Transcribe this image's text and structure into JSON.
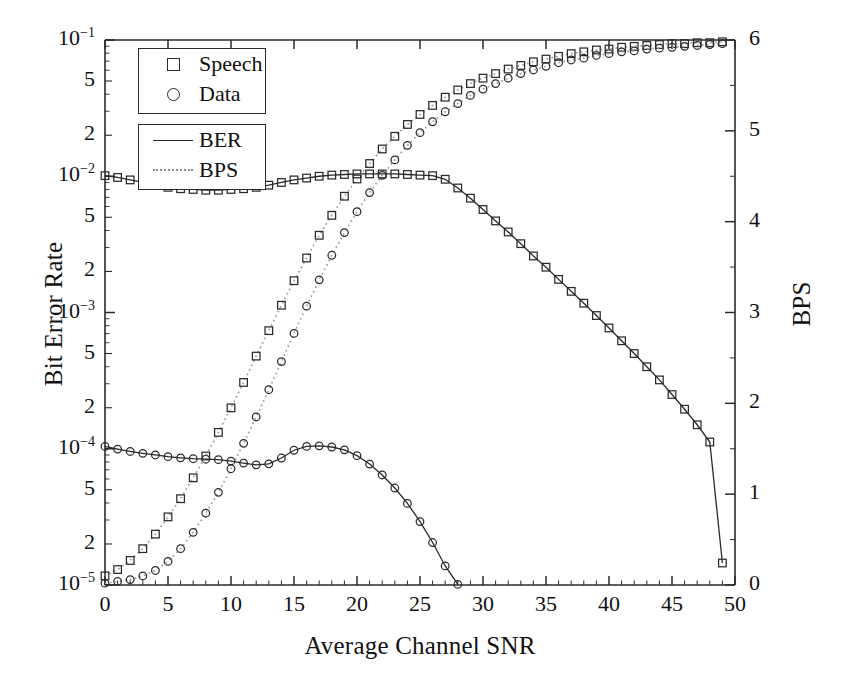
{
  "chart_data": {
    "type": "line",
    "title": "",
    "xlabel": "Average Channel SNR",
    "ylabel": "Bit Error Rate",
    "ylabel_right": "BPS",
    "xlim": [
      0,
      50
    ],
    "xticks": [
      0,
      5,
      10,
      15,
      20,
      25,
      30,
      35,
      40,
      45,
      50
    ],
    "ylim_left": [
      1e-05,
      0.1
    ],
    "yscale_left": "log",
    "yticks_left": [
      {
        "value": 0.1,
        "label": "10-1"
      },
      {
        "value": 0.05,
        "label": "5"
      },
      {
        "value": 0.02,
        "label": "2"
      },
      {
        "value": 0.01,
        "label": "10-2"
      },
      {
        "value": 0.005,
        "label": "5"
      },
      {
        "value": 0.002,
        "label": "2"
      },
      {
        "value": 0.001,
        "label": "10-3"
      },
      {
        "value": 0.0005,
        "label": "5"
      },
      {
        "value": 0.0002,
        "label": "2"
      },
      {
        "value": 0.0001,
        "label": "10-4"
      },
      {
        "value": 5e-05,
        "label": "5"
      },
      {
        "value": 2e-05,
        "label": "2"
      },
      {
        "value": 1e-05,
        "label": "10-5"
      }
    ],
    "ylim_right": [
      0,
      6
    ],
    "yticks_right": [
      0,
      1,
      2,
      3,
      4,
      5,
      6
    ],
    "grid": false,
    "legend_position": "upper-left",
    "legend_marker_entries": [
      {
        "label": "Speech",
        "marker": "square"
      },
      {
        "label": "Data",
        "marker": "circle"
      }
    ],
    "legend_style_entries": [
      {
        "label": "BER",
        "style": "solid"
      },
      {
        "label": "BPS",
        "style": "dotted"
      }
    ],
    "series": [
      {
        "name": "Speech BER",
        "marker": "square",
        "style": "solid",
        "axis": "left",
        "x": [
          0,
          1,
          2,
          3,
          4,
          5,
          6,
          7,
          8,
          9,
          10,
          11,
          12,
          13,
          14,
          15,
          16,
          17,
          18,
          19,
          20,
          21,
          22,
          23,
          24,
          25,
          26,
          27,
          28,
          29,
          30,
          31,
          32,
          33,
          34,
          35,
          36,
          37,
          38,
          39,
          40,
          41,
          42,
          43,
          44,
          45,
          46,
          47,
          48,
          49
        ],
        "y": [
          0.0101,
          0.0098,
          0.0094,
          0.009,
          0.0086,
          0.0083,
          0.0081,
          0.008,
          0.0079,
          0.0079,
          0.008,
          0.0081,
          0.0083,
          0.0086,
          0.009,
          0.0094,
          0.0097,
          0.01,
          0.0102,
          0.0103,
          0.0104,
          0.0104,
          0.0104,
          0.0104,
          0.0103,
          0.0102,
          0.0101,
          0.0095,
          0.0082,
          0.0069,
          0.0057,
          0.0047,
          0.0039,
          0.0032,
          0.0026,
          0.00215,
          0.00175,
          0.00143,
          0.00117,
          0.00095,
          0.00077,
          0.00062,
          0.0005,
          0.0004,
          0.00032,
          0.00025,
          0.000195,
          0.00015,
          0.000112,
          1.45e-05
        ]
      },
      {
        "name": "Data BER",
        "marker": "circle",
        "style": "solid",
        "axis": "left",
        "x": [
          0,
          1,
          2,
          3,
          4,
          5,
          6,
          7,
          8,
          9,
          10,
          11,
          12,
          13,
          14,
          15,
          16,
          17,
          18,
          19,
          20,
          21,
          22,
          23,
          24,
          25,
          26,
          27,
          28
        ],
        "y": [
          0.000104,
          9.95e-05,
          9.55e-05,
          9.25e-05,
          9e-05,
          8.75e-05,
          8.58e-05,
          8.45e-05,
          8.38e-05,
          8.32e-05,
          8.12e-05,
          7.85e-05,
          7.62e-05,
          7.75e-05,
          8.55e-05,
          9.75e-05,
          0.000104,
          0.000105,
          0.000103,
          9.82e-05,
          8.9e-05,
          7.72e-05,
          6.42e-05,
          5.15e-05,
          3.97e-05,
          2.92e-05,
          2.05e-05,
          1.38e-05,
          1.01e-05
        ]
      },
      {
        "name": "Speech BPS",
        "marker": "square",
        "style": "dotted",
        "axis": "right",
        "x": [
          0,
          1,
          2,
          3,
          4,
          5,
          6,
          7,
          8,
          9,
          10,
          11,
          12,
          13,
          14,
          15,
          16,
          17,
          18,
          19,
          20,
          21,
          22,
          23,
          24,
          25,
          26,
          27,
          28,
          29,
          30,
          31,
          32,
          33,
          34,
          35,
          36,
          37,
          38,
          39,
          40,
          41,
          42,
          43,
          44,
          45,
          46,
          47,
          48,
          49
        ],
        "y": [
          0.1,
          0.17,
          0.27,
          0.4,
          0.56,
          0.75,
          0.95,
          1.18,
          1.42,
          1.68,
          1.95,
          2.23,
          2.52,
          2.8,
          3.08,
          3.35,
          3.6,
          3.85,
          4.07,
          4.28,
          4.47,
          4.64,
          4.8,
          4.94,
          5.07,
          5.18,
          5.28,
          5.37,
          5.45,
          5.52,
          5.58,
          5.63,
          5.68,
          5.72,
          5.76,
          5.79,
          5.82,
          5.85,
          5.87,
          5.89,
          5.9,
          5.92,
          5.93,
          5.94,
          5.95,
          5.96,
          5.96,
          5.97,
          5.97,
          5.98
        ]
      },
      {
        "name": "Data BPS",
        "marker": "circle",
        "style": "dotted",
        "axis": "right",
        "x": [
          0,
          1,
          2,
          3,
          4,
          5,
          6,
          7,
          8,
          9,
          10,
          11,
          12,
          13,
          14,
          15,
          16,
          17,
          18,
          19,
          20,
          21,
          22,
          23,
          24,
          25,
          26,
          27,
          28,
          29,
          30,
          31,
          32,
          33,
          34,
          35,
          36,
          37,
          38,
          39,
          40,
          41,
          42,
          43,
          44,
          45,
          46,
          47,
          48,
          49
        ],
        "y": [
          0.02,
          0.04,
          0.06,
          0.1,
          0.16,
          0.26,
          0.4,
          0.58,
          0.79,
          1.02,
          1.28,
          1.56,
          1.85,
          2.15,
          2.46,
          2.77,
          3.07,
          3.36,
          3.63,
          3.88,
          4.11,
          4.32,
          4.51,
          4.68,
          4.84,
          4.98,
          5.1,
          5.21,
          5.3,
          5.39,
          5.46,
          5.52,
          5.58,
          5.63,
          5.67,
          5.71,
          5.75,
          5.78,
          5.8,
          5.83,
          5.85,
          5.87,
          5.88,
          5.9,
          5.91,
          5.92,
          5.93,
          5.94,
          5.95,
          5.96
        ]
      }
    ]
  },
  "colors": {
    "axis": "#2a2a2a",
    "marker_stroke": "#2a2a2a",
    "ber_line": "#2a2a2a",
    "bps_line": "#9a9a9a",
    "background": "#ffffff"
  }
}
